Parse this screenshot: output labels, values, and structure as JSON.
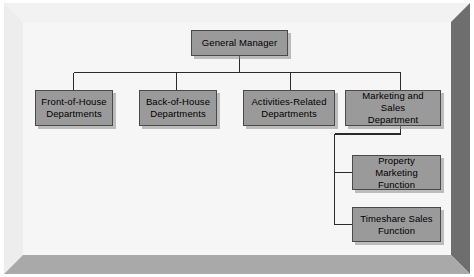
{
  "diagram": {
    "type": "org-chart",
    "frame": {
      "style": "beveled-3d-border",
      "panel_color": "#f6f6f6",
      "bevel_light_color": "#f0f0f0",
      "bevel_dark_color": "#6e6e6e",
      "bevel_bottom_color": "#a9a9a9"
    },
    "node_style": {
      "fill_color": "#9a9a9a",
      "border_color": "#4a4a4a",
      "shadow_color": "#8c8c8c",
      "text_color": "#000000"
    },
    "connector_color": "#2b2b2b",
    "nodes": [
      {
        "id": "gm",
        "label": "General Manager",
        "level": 0
      },
      {
        "id": "front",
        "label": "Front-of-House\nDepartments",
        "line1": "Front-of-House",
        "line2": "Departments",
        "level": 1
      },
      {
        "id": "back",
        "label": "Back-of-House\nDepartments",
        "line1": "Back-of-House",
        "line2": "Departments",
        "level": 1
      },
      {
        "id": "activities",
        "label": "Activities-Related\nDepartments",
        "line1": "Activities-Related",
        "line2": "Departments",
        "level": 1
      },
      {
        "id": "marketing",
        "label": "Marketing and Sales\nDepartment",
        "line1": "Marketing and Sales",
        "line2": "Department",
        "level": 1
      },
      {
        "id": "property",
        "label": "Property Marketing\nFunction",
        "line1": "Property Marketing",
        "line2": "Function",
        "level": 2
      },
      {
        "id": "timeshare",
        "label": "Timeshare Sales\nFunction",
        "line1": "Timeshare Sales",
        "line2": "Function",
        "level": 2
      }
    ],
    "edges": [
      {
        "from": "gm",
        "to": "front"
      },
      {
        "from": "gm",
        "to": "back"
      },
      {
        "from": "gm",
        "to": "activities"
      },
      {
        "from": "gm",
        "to": "marketing"
      },
      {
        "from": "marketing",
        "to": "property"
      },
      {
        "from": "marketing",
        "to": "timeshare"
      }
    ]
  }
}
